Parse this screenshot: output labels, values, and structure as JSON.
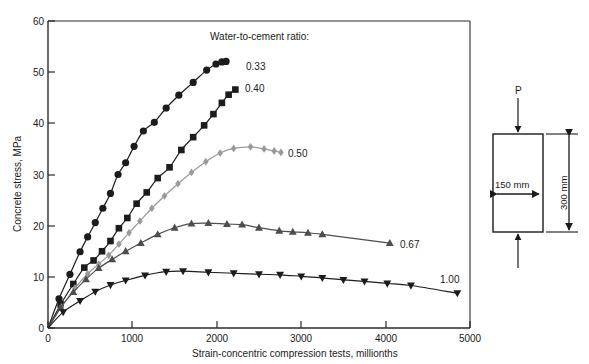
{
  "chart_data": {
    "type": "line",
    "title": "",
    "xlabel": "Strain-concentric compression tests, millionths",
    "ylabel": "Concrete stress, MPa",
    "xlim": [
      0,
      5000
    ],
    "ylim": [
      0,
      60
    ],
    "xticks": [
      0,
      1000,
      2000,
      3000,
      4000,
      5000
    ],
    "yticks": [
      0,
      10,
      20,
      30,
      40,
      50,
      60
    ],
    "grid": false,
    "legend_title": "Water-to-cement ratio:",
    "legend_position": "inline-right-of-curve-ends",
    "series": [
      {
        "name": "0.33",
        "label": "0.33",
        "marker": "circle",
        "color": "#1c1c1c",
        "x": [
          0,
          130,
          260,
          380,
          470,
          560,
          650,
          740,
          830,
          920,
          1020,
          1130,
          1260,
          1400,
          1550,
          1720,
          1880,
          1990,
          2060,
          2110
        ],
        "y": [
          0,
          5.7,
          10.5,
          14.9,
          17.8,
          20.6,
          23.4,
          26.3,
          30.0,
          32.3,
          35.5,
          38.5,
          40.2,
          43.0,
          45.5,
          48.0,
          50.4,
          51.6,
          52.0,
          52.1
        ]
      },
      {
        "name": "0.40",
        "label": "0.40",
        "marker": "square",
        "color": "#1c1c1c",
        "x": [
          0,
          150,
          300,
          430,
          540,
          640,
          740,
          840,
          940,
          1050,
          1170,
          1300,
          1440,
          1580,
          1720,
          1850,
          1960,
          2060,
          2140,
          2220
        ],
        "y": [
          0,
          4.6,
          8.6,
          11.8,
          13.2,
          15.0,
          17.0,
          19.5,
          21.5,
          24.3,
          26.5,
          29.3,
          31.4,
          34.8,
          37.3,
          39.6,
          41.8,
          44.0,
          45.6,
          46.6
        ]
      },
      {
        "name": "0.50",
        "label": "0.50",
        "marker": "diamond",
        "color": "#9a9a9a",
        "x": [
          0,
          160,
          320,
          470,
          600,
          720,
          840,
          960,
          1090,
          1230,
          1380,
          1540,
          1700,
          1870,
          2040,
          2200,
          2400,
          2560,
          2680,
          2760
        ],
        "y": [
          0,
          4.1,
          7.8,
          10.6,
          12.5,
          14.2,
          16.4,
          18.6,
          20.9,
          23.4,
          25.8,
          28.2,
          30.4,
          32.5,
          34.2,
          35.1,
          35.4,
          35.0,
          34.6,
          34.3
        ]
      },
      {
        "name": "0.67",
        "label": "0.67",
        "marker": "triangle-up",
        "color": "#4d4d4d",
        "x": [
          0,
          150,
          300,
          450,
          600,
          760,
          920,
          1100,
          1300,
          1500,
          1700,
          1900,
          2120,
          2300,
          2500,
          2740,
          2900,
          3080,
          3250,
          4050
        ],
        "y": [
          0,
          4.0,
          7.0,
          9.5,
          11.7,
          13.4,
          15.0,
          16.6,
          18.3,
          19.6,
          20.4,
          20.5,
          20.3,
          20.2,
          19.6,
          19.0,
          18.8,
          18.6,
          18.3,
          16.6
        ]
      },
      {
        "name": "1.00",
        "label": "1.00",
        "marker": "triangle-down",
        "color": "#1c1c1c",
        "x": [
          0,
          180,
          380,
          560,
          740,
          920,
          1150,
          1400,
          1600,
          1900,
          2200,
          2500,
          2750,
          3000,
          3250,
          3500,
          3750,
          4020,
          4300,
          4850
        ],
        "y": [
          0,
          3.1,
          5.3,
          7.1,
          8.4,
          9.3,
          10.3,
          11.0,
          11.1,
          10.9,
          10.7,
          10.5,
          10.4,
          10.1,
          9.8,
          9.4,
          9.1,
          8.7,
          8.3,
          6.8
        ]
      }
    ]
  },
  "axis": {
    "y_ticks": [
      "0",
      "10",
      "20",
      "30",
      "40",
      "50",
      "60"
    ],
    "x_ticks": [
      "0",
      "1000",
      "2000",
      "3000",
      "4000",
      "5000"
    ],
    "x_title": "Strain-concentric compression tests, millionths",
    "y_title": "Concrete stress, MPa"
  },
  "legend": {
    "title": "Water-to-cement ratio:",
    "labels": [
      "0.33",
      "0.40",
      "0.50",
      "0.67",
      "1.00"
    ]
  },
  "specimen": {
    "load_label": "P",
    "width_label": "150 mm",
    "height_label": "300 mm"
  }
}
